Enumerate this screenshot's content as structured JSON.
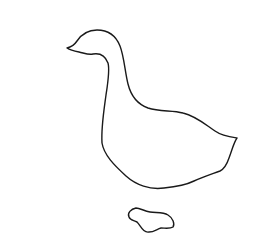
{
  "image": {
    "description": "Line drawing of a goose outline with a separate foot shape",
    "background_color": "#ffffff",
    "stroke_color": "#1a1a1a"
  },
  "figure": {
    "subject": "goose",
    "parts": [
      "goose-body-outline",
      "goose-foot-outline"
    ]
  }
}
